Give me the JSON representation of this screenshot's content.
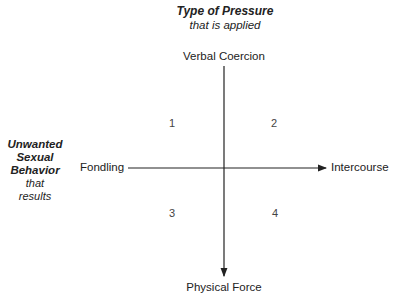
{
  "diagram": {
    "vertical_axis": {
      "title": "Type of Pressure",
      "subtitle": "that is applied",
      "top_label": "Verbal Coercion",
      "bottom_label": "Physical Force"
    },
    "horizontal_axis": {
      "title_lines": [
        "Unwanted",
        "Sexual",
        "Behavior"
      ],
      "subtitle_lines": [
        "that",
        "results"
      ],
      "left_label": "Fondling",
      "right_label": "Intercourse"
    },
    "quadrants": [
      "1",
      "2",
      "3",
      "4"
    ],
    "colors": {
      "line": "#222222",
      "text": "#222222"
    }
  }
}
